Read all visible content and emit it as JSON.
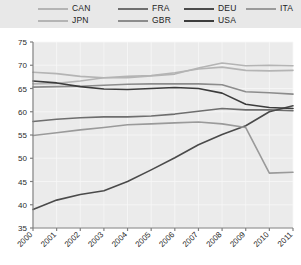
{
  "chart_data": {
    "type": "line",
    "title": "",
    "xlabel": "",
    "ylabel": "",
    "x": [
      2000,
      2001,
      2002,
      2003,
      2004,
      2005,
      2006,
      2007,
      2008,
      2009,
      2010,
      2011
    ],
    "xtick_labels": [
      "2000",
      "2001",
      "2002",
      "2003",
      "2004",
      "2005",
      "2006",
      "2007",
      "2008",
      "2009",
      "2010",
      "2011"
    ],
    "ytick_labels": [
      "35",
      "40",
      "45",
      "50",
      "55",
      "60",
      "65",
      "70",
      "75"
    ],
    "yticks": [
      35,
      40,
      45,
      50,
      55,
      60,
      65,
      70,
      75
    ],
    "ylim": [
      35,
      75
    ],
    "xlim": [
      2000,
      2011
    ],
    "grid": true,
    "legend_position": "top",
    "plot_background": "#ebebeb",
    "legend_background": "#e8e8e8",
    "series": [
      {
        "name": "CAN",
        "color": "#b4b4b4",
        "values": [
          66.0,
          66.1,
          66.6,
          67.3,
          67.6,
          67.8,
          68.4,
          69.2,
          69.6,
          68.9,
          68.8,
          68.9
        ]
      },
      {
        "name": "JPN",
        "color": "#b4b4b4",
        "values": [
          68.5,
          68.2,
          67.6,
          67.3,
          67.3,
          67.7,
          68.1,
          69.4,
          70.5,
          69.9,
          70.0,
          69.9
        ]
      },
      {
        "name": "FRA",
        "color": "#6e6e6e",
        "values": [
          57.9,
          58.4,
          58.7,
          58.9,
          58.9,
          59.1,
          59.5,
          60.1,
          60.7,
          60.4,
          60.4,
          60.2
        ]
      },
      {
        "name": "GBR",
        "color": "#8c8c8c",
        "values": [
          65.3,
          65.4,
          65.5,
          65.7,
          65.9,
          66.0,
          66.0,
          66.0,
          65.8,
          64.3,
          64.1,
          63.8
        ]
      },
      {
        "name": "DEU",
        "color": "#4a4a4a",
        "values": [
          39.0,
          41.0,
          42.2,
          43.0,
          45.0,
          47.5,
          50.1,
          52.9,
          55.1,
          57.0,
          60.0,
          61.3
        ]
      },
      {
        "name": "USA",
        "color": "#3c3c3c",
        "values": [
          66.6,
          66.2,
          65.4,
          64.9,
          64.8,
          65.0,
          65.2,
          65.0,
          64.0,
          61.6,
          60.9,
          60.7
        ]
      },
      {
        "name": "ITA",
        "color": "#9a9a9a",
        "values": [
          54.9,
          55.5,
          56.1,
          56.6,
          57.2,
          57.4,
          57.6,
          57.8,
          57.4,
          56.6,
          46.8,
          47.0
        ]
      }
    ]
  },
  "legend": {
    "rows": [
      [
        {
          "label": "CAN",
          "color": "#b4b4b4"
        },
        {
          "label": "FRA",
          "color": "#6e6e6e"
        },
        {
          "label": "DEU",
          "color": "#4a4a4a"
        },
        {
          "label": "ITA",
          "color": "#9a9a9a"
        }
      ],
      [
        {
          "label": "JPN",
          "color": "#b4b4b4"
        },
        {
          "label": "GBR",
          "color": "#8c8c8c"
        },
        {
          "label": "USA",
          "color": "#3c3c3c"
        }
      ]
    ]
  }
}
